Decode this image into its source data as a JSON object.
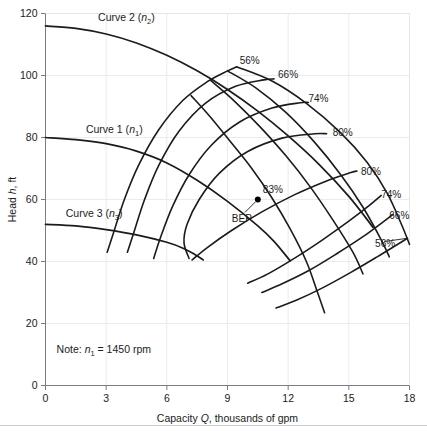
{
  "figure": {
    "name": "pump-performance-curve",
    "background": "#ffffff",
    "line_color": "#1b1b1b",
    "grid_color": "#e9ebee",
    "axis_color": "#7a7d82"
  },
  "axes": {
    "x": {
      "label_prefix": "Capacity ",
      "label_symbol": "Q",
      "label_suffix": ", thousands of gpm",
      "label_full": "Capacity Q, thousands of gpm",
      "min": 0,
      "max": 18,
      "ticks": [
        0,
        3,
        6,
        9,
        12,
        15,
        18
      ],
      "tick_labels": [
        "0",
        "3",
        "6",
        "9",
        "12",
        "15",
        "18"
      ]
    },
    "y": {
      "label_prefix": "Head ",
      "label_symbol": "h",
      "label_suffix": ", ft",
      "label_full": "Head h, ft",
      "min": 0,
      "max": 120,
      "ticks": [
        0,
        20,
        40,
        60,
        80,
        100,
        120
      ],
      "tick_labels": [
        "0",
        "20",
        "40",
        "60",
        "80",
        "100",
        "120"
      ]
    }
  },
  "note": {
    "prefix": "Note: ",
    "symbol": "n",
    "subscript": "1",
    "value": " = 1450 rpm",
    "text_full": "Note: n1 = 1450 rpm"
  },
  "bep": {
    "label": "BEP",
    "efficiency_label": "83%",
    "x": 10.5,
    "y": 60
  },
  "head_curves": [
    {
      "name": "Curve 1",
      "speed_symbol": "n",
      "speed_subscript": "1",
      "label": "Curve 1 (n1)",
      "label_x": 2.0,
      "label_y": 81.5,
      "points": [
        [
          0,
          80
        ],
        [
          1.5,
          79.3
        ],
        [
          3,
          78
        ],
        [
          4.5,
          75.6
        ],
        [
          6,
          71.8
        ],
        [
          7.5,
          66.2
        ],
        [
          9,
          59.4
        ],
        [
          10.5,
          51.5
        ],
        [
          11.3,
          46.5
        ],
        [
          12.1,
          40.2
        ]
      ]
    },
    {
      "name": "Curve 2",
      "speed_symbol": "n",
      "speed_subscript": "2",
      "label": "Curve 2 (n2)",
      "label_x": 2.6,
      "label_y": 117.5,
      "points": [
        [
          0,
          116
        ],
        [
          1.5,
          115.2
        ],
        [
          3,
          113.4
        ],
        [
          4.5,
          110.5
        ],
        [
          6,
          106.5
        ],
        [
          7.5,
          101.5
        ],
        [
          9,
          95.5
        ],
        [
          10.5,
          88.5
        ],
        [
          12,
          80.5
        ],
        [
          13.5,
          71.5
        ],
        [
          15,
          61
        ],
        [
          16.2,
          51
        ]
      ]
    },
    {
      "name": "Curve 3",
      "speed_symbol": "n",
      "speed_subscript": "3",
      "label": "Curve 3 (n3)",
      "label_x": 1.0,
      "label_y": 54.5,
      "points": [
        [
          0,
          52
        ],
        [
          1.5,
          51.5
        ],
        [
          3,
          50.3
        ],
        [
          4.5,
          48.6
        ],
        [
          6,
          46.2
        ],
        [
          6.8,
          44.3
        ],
        [
          7.4,
          42.2
        ],
        [
          7.8,
          40.5
        ]
      ]
    }
  ],
  "efficiency_curves": [
    {
      "label": "56%",
      "side": "upper",
      "label_x": 9.6,
      "label_y": 105,
      "points": [
        [
          3.05,
          43
        ],
        [
          3.4,
          50
        ],
        [
          3.9,
          60
        ],
        [
          4.6,
          71
        ],
        [
          5.6,
          82.5
        ],
        [
          6.8,
          92
        ],
        [
          8.0,
          98
        ],
        [
          9.0,
          101.5
        ],
        [
          9.45,
          102.8
        ]
      ]
    },
    {
      "label": "66%",
      "side": "upper",
      "label_x": 11.5,
      "label_y": 100.5,
      "points": [
        [
          4.05,
          43
        ],
        [
          4.4,
          50
        ],
        [
          4.9,
          60
        ],
        [
          5.6,
          71
        ],
        [
          6.6,
          82
        ],
        [
          7.9,
          91
        ],
        [
          9.4,
          96.5
        ],
        [
          10.8,
          98.6
        ],
        [
          11.3,
          98.9
        ]
      ]
    },
    {
      "label": "74%",
      "side": "upper",
      "label_x": 13.0,
      "label_y": 92.5,
      "points": [
        [
          5.35,
          41
        ],
        [
          5.7,
          48
        ],
        [
          6.3,
          58
        ],
        [
          7.1,
          68
        ],
        [
          8.2,
          77.5
        ],
        [
          9.6,
          85
        ],
        [
          11.2,
          89.5
        ],
        [
          12.6,
          91.2
        ],
        [
          13.0,
          91.3
        ]
      ]
    },
    {
      "label": "80%",
      "side": "upper",
      "label_x": 14.2,
      "label_y": 81.5,
      "points": [
        [
          7.1,
          41
        ],
        [
          6.85,
          46
        ],
        [
          7.0,
          52
        ],
        [
          7.6,
          60
        ],
        [
          8.6,
          68.5
        ],
        [
          10.0,
          75.5
        ],
        [
          11.7,
          79.8
        ],
        [
          13.3,
          81.2
        ],
        [
          13.9,
          81.2
        ]
      ]
    },
    {
      "label": "80%",
      "side": "lower",
      "label_x": 15.6,
      "label_y": 69,
      "points": [
        [
          7.25,
          40.5
        ],
        [
          8.0,
          44.5
        ],
        [
          9.2,
          50
        ],
        [
          10.7,
          56
        ],
        [
          12.3,
          61.5
        ],
        [
          13.9,
          66
        ],
        [
          15.1,
          68.7
        ],
        [
          15.4,
          69.2
        ]
      ]
    },
    {
      "label": "74%",
      "side": "lower",
      "label_x": 16.6,
      "label_y": 61.5,
      "points": [
        [
          10.0,
          33
        ],
        [
          11.0,
          36
        ],
        [
          12.3,
          41
        ],
        [
          13.7,
          47
        ],
        [
          15.0,
          53
        ],
        [
          16.0,
          58
        ],
        [
          16.6,
          61.3
        ]
      ]
    },
    {
      "label": "66%",
      "side": "lower",
      "label_x": 17.0,
      "label_y": 55,
      "points": [
        [
          10.7,
          30
        ],
        [
          11.7,
          32.8
        ],
        [
          13.0,
          37
        ],
        [
          14.4,
          42.5
        ],
        [
          15.7,
          48
        ],
        [
          16.7,
          52.8
        ],
        [
          17.2,
          55.3
        ]
      ]
    },
    {
      "label": "56%",
      "side": "lower",
      "label_x": 16.3,
      "label_y": 46,
      "points": [
        [
          11.4,
          25
        ],
        [
          12.4,
          27.5
        ],
        [
          13.7,
          31.5
        ],
        [
          15.1,
          36.5
        ],
        [
          16.4,
          41.5
        ],
        [
          17.4,
          45.5
        ],
        [
          17.9,
          47.5
        ]
      ]
    }
  ],
  "iso_speed_lines": [
    {
      "name": "iso-speed-56-66",
      "points": [
        [
          9.45,
          102.8
        ],
        [
          11.2,
          98.2
        ],
        [
          12.9,
          91
        ],
        [
          14.6,
          81.5
        ],
        [
          15.9,
          72
        ],
        [
          16.9,
          62
        ],
        [
          17.6,
          52
        ],
        [
          18.0,
          45.5
        ]
      ]
    },
    {
      "name": "iso-speed-66-74",
      "points": [
        [
          9.0,
          101.5
        ],
        [
          10.4,
          96
        ],
        [
          11.9,
          88
        ],
        [
          13.3,
          78.5
        ],
        [
          14.6,
          68
        ],
        [
          15.7,
          57.5
        ],
        [
          16.6,
          47
        ],
        [
          17.0,
          41.5
        ]
      ]
    },
    {
      "name": "iso-speed-74-80",
      "points": [
        [
          8.15,
          98.5
        ],
        [
          9.3,
          92
        ],
        [
          10.6,
          83.5
        ],
        [
          11.9,
          74
        ],
        [
          13.1,
          64
        ],
        [
          14.2,
          53.5
        ],
        [
          15.2,
          43
        ],
        [
          15.7,
          36
        ]
      ]
    },
    {
      "name": "iso-speed-80-83",
      "points": [
        [
          7.2,
          93.5
        ],
        [
          8.1,
          87
        ],
        [
          9.1,
          79
        ],
        [
          10.2,
          70
        ],
        [
          11.2,
          60.5
        ],
        [
          12.1,
          50.5
        ],
        [
          12.9,
          40
        ],
        [
          13.4,
          31
        ],
        [
          13.8,
          23.5
        ]
      ]
    }
  ],
  "chart_data": {
    "type": "line",
    "title": "",
    "xlabel": "Capacity Q, thousands of gpm",
    "ylabel": "Head h, ft",
    "xlim": [
      0,
      18
    ],
    "ylim": [
      0,
      120
    ],
    "xticks": [
      0,
      3,
      6,
      9,
      12,
      15,
      18
    ],
    "yticks": [
      0,
      20,
      40,
      60,
      80,
      100,
      120
    ],
    "grid": true,
    "legend": "none",
    "annotations": [
      "Curve 1 (n1)",
      "Curve 2 (n2)",
      "Curve 3 (n3)",
      "BEP",
      "83%",
      "Note: n1 = 1450 rpm"
    ],
    "series": [
      {
        "name": "Curve 2 (n2)",
        "x": [
          0,
          1.5,
          3,
          4.5,
          6,
          7.5,
          9,
          10.5,
          12,
          13.5,
          15,
          16.2
        ],
        "values": [
          116,
          115.2,
          113.4,
          110.5,
          106.5,
          101.5,
          95.5,
          88.5,
          80.5,
          71.5,
          61,
          51
        ]
      },
      {
        "name": "Curve 1 (n1)",
        "x": [
          0,
          1.5,
          3,
          4.5,
          6,
          7.5,
          9,
          10.5,
          11.3,
          12.1
        ],
        "values": [
          80,
          79.3,
          78,
          75.6,
          71.8,
          66.2,
          59.4,
          51.5,
          46.5,
          40.2
        ]
      },
      {
        "name": "Curve 3 (n3)",
        "x": [
          0,
          1.5,
          3,
          4.5,
          6,
          6.8,
          7.4,
          7.8
        ],
        "values": [
          52,
          51.5,
          50.3,
          48.6,
          46.2,
          44.3,
          42.2,
          40.5
        ]
      }
    ],
    "efficiency_contours": [
      "56%",
      "66%",
      "74%",
      "80%",
      "83%",
      "80%",
      "74%",
      "66%",
      "56%"
    ],
    "bep_point": {
      "x": 10.5,
      "y": 60,
      "efficiency": "83%"
    },
    "note": "Note: n1 = 1450 rpm"
  }
}
